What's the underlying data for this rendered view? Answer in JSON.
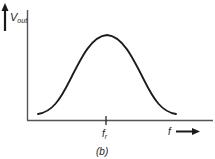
{
  "diagram": {
    "type": "resonance-curve",
    "y_axis": {
      "label": "V",
      "label_sub": "out"
    },
    "x_axis": {
      "label": "f"
    },
    "marker": {
      "label": "f",
      "label_sub": "r"
    },
    "caption": "(b)",
    "colors": {
      "line": "#1a1a1a",
      "axis": "#555555",
      "background": "#ffffff"
    }
  }
}
